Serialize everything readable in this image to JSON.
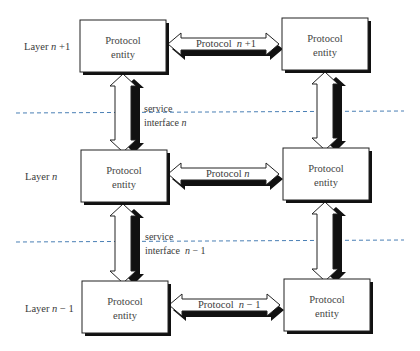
{
  "diagram": {
    "type": "layered-protocol-architecture",
    "colors": {
      "dashed_line": "#4a7fb5",
      "box_border": "#222222",
      "shadow": "#111111"
    },
    "layers": [
      {
        "label": "Layer  n +1",
        "label_prefix": "Layer",
        "label_var": "n",
        "label_suffix": "+1",
        "left_entity": "Protocol\nentity",
        "left_line1": "Protocol",
        "left_line2": "entity",
        "right_line1": "Protocol",
        "right_line2": "entity",
        "protocol_prefix": "Protocol",
        "protocol_var": "n",
        "protocol_suffix": "+1"
      },
      {
        "label": "Layer n",
        "label_prefix": "Layer",
        "label_var": "n",
        "label_suffix": "",
        "left_line1": "Protocol",
        "left_line2": "entity",
        "right_line1": "Protocol",
        "right_line2": "entity",
        "protocol_prefix": "Protocol",
        "protocol_var": "n",
        "protocol_suffix": ""
      },
      {
        "label": "Layer n − 1",
        "label_prefix": "Layer",
        "label_var": "n",
        "label_suffix": "− 1",
        "left_line1": "Protocol",
        "left_line2": "entity",
        "right_line1": "Protocol",
        "right_line2": "entity",
        "protocol_prefix": "Protocol",
        "protocol_var": "n",
        "protocol_suffix": "− 1"
      }
    ],
    "interfaces": [
      {
        "line1": "service",
        "line2_prefix": "interface",
        "line2_var": "n",
        "line2_suffix": ""
      },
      {
        "line1": "service",
        "line2_prefix": "interface",
        "line2_var": "n",
        "line2_suffix": "−  1"
      }
    ]
  }
}
